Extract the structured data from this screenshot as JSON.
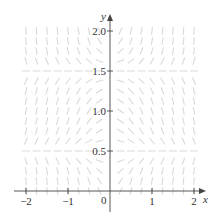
{
  "chart_data": {
    "type": "slope-field",
    "title": "",
    "differential_equation": "dy/dx = x (y - 0.5)(y - 1.5)",
    "xlabel": "x",
    "ylabel": "y",
    "xlim": [
      -2.2,
      2.3
    ],
    "ylim": [
      -0.15,
      2.15
    ],
    "grid": false,
    "legend": "none",
    "x_ticks": [
      {
        "value": -2,
        "label": "−2"
      },
      {
        "value": -1,
        "label": "−1"
      },
      {
        "value": 1,
        "label": "1"
      },
      {
        "value": 2,
        "label": "2"
      }
    ],
    "origin_label": "0",
    "y_ticks": [
      {
        "value": 0.5,
        "label": "0.5"
      },
      {
        "value": 1.0,
        "label": "1.0"
      },
      {
        "value": 1.5,
        "label": "1.5"
      },
      {
        "value": 2.0,
        "label": "2.0"
      }
    ],
    "field_grid": {
      "x_start": -2,
      "x_end": 2,
      "x_step": 0.25,
      "y_start": 0.0,
      "y_end": 2.0,
      "y_step": 0.125
    },
    "equilibria_y": [
      0.5,
      1.5
    ],
    "segment_color": "#d9d9d9",
    "axis_color": "#444444"
  }
}
